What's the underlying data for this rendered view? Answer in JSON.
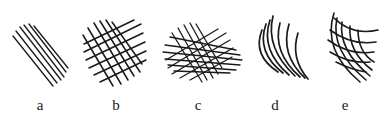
{
  "figure": {
    "ink_color": "#1a1a1a",
    "background": "#ffffff",
    "panels": [
      {
        "id": "a",
        "label": "a",
        "pattern": "parallel-hatching",
        "label_x": 40
      },
      {
        "id": "b",
        "label": "b",
        "pattern": "cross-hatching",
        "label_x": 116
      },
      {
        "id": "c",
        "label": "c",
        "pattern": "dense-multi-direction-hatching",
        "label_x": 198
      },
      {
        "id": "d",
        "label": "d",
        "pattern": "curved-parallel-hatching",
        "label_x": 275
      },
      {
        "id": "e",
        "label": "e",
        "pattern": "curved-cross-hatching",
        "label_x": 345
      }
    ]
  }
}
